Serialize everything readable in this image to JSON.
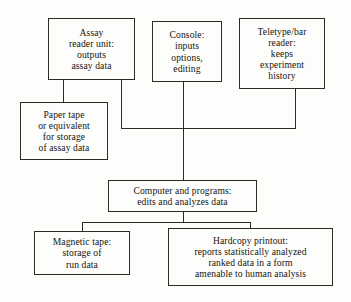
{
  "diagram": {
    "background_color": "#fdfdfb",
    "line_color": "#2b2b28",
    "text_color": "#15140f",
    "nodes": [
      {
        "id": "assay_reader",
        "text": "Assay\nreader unit:\noutputs\nassay data"
      },
      {
        "id": "console",
        "text": "Console:\ninputs\noptions,\nediting"
      },
      {
        "id": "teletype",
        "text": "Teletype/bar\nreader:\nkeeps\nexperiment\nhistory"
      },
      {
        "id": "paper_tape",
        "text": "Paper tape\nor equivalent\nfor storage\nof assay data"
      },
      {
        "id": "computer",
        "text": "Computer and programs:\nedits and analyzes data"
      },
      {
        "id": "magnetic_tape",
        "text": "Magnetic tape:\nstorage of\nrun data"
      },
      {
        "id": "hardcopy",
        "text": "Hardcopy printout:\nreports statistically analyzed\nranked data in a form\namenable to human analysis"
      }
    ],
    "edges": [
      {
        "id": "assay_to_paper_tape",
        "from": "assay_reader",
        "to": "paper_tape"
      },
      {
        "id": "assay_to_bus",
        "from": "assay_reader",
        "to": "computer"
      },
      {
        "id": "console_to_computer",
        "from": "console",
        "to": "computer"
      },
      {
        "id": "teletype_to_bus",
        "from": "teletype",
        "to": "computer"
      },
      {
        "id": "input_bus",
        "from": "inputs",
        "to": "computer"
      },
      {
        "id": "computer_to_lower_bus",
        "from": "computer",
        "to": "outputs"
      },
      {
        "id": "output_bus",
        "from": "computer",
        "to": "outputs"
      },
      {
        "id": "bus_to_magnetic_tape",
        "from": "computer",
        "to": "magnetic_tape"
      },
      {
        "id": "bus_to_hardcopy",
        "from": "computer",
        "to": "hardcopy"
      }
    ]
  }
}
